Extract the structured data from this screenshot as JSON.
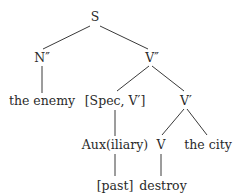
{
  "diagram": {
    "type": "syntax-tree",
    "nodes": [
      {
        "id": "S",
        "label": "S",
        "x": 95,
        "y": 17
      },
      {
        "id": "N2",
        "label": "N″",
        "x": 42,
        "y": 58
      },
      {
        "id": "V2",
        "label": "V″",
        "x": 152,
        "y": 58
      },
      {
        "id": "enemy",
        "label": "the enemy",
        "x": 42,
        "y": 101
      },
      {
        "id": "spec",
        "label": "[Spec, V′]",
        "x": 115,
        "y": 101
      },
      {
        "id": "V1",
        "label": "V′",
        "x": 186,
        "y": 101
      },
      {
        "id": "aux",
        "label": "Aux(iliary)",
        "x": 115,
        "y": 145
      },
      {
        "id": "V",
        "label": "V",
        "x": 161,
        "y": 145
      },
      {
        "id": "city",
        "label": "the city",
        "x": 208,
        "y": 145
      },
      {
        "id": "past",
        "label": "[past]",
        "x": 115,
        "y": 186
      },
      {
        "id": "destroy",
        "label": "destroy",
        "x": 163,
        "y": 186
      }
    ],
    "edges": [
      {
        "from": "S",
        "to": "N2",
        "x1": 90,
        "y1": 26,
        "x2": 43,
        "y2": 49
      },
      {
        "from": "S",
        "to": "V2",
        "x1": 100,
        "y1": 26,
        "x2": 148,
        "y2": 49
      },
      {
        "from": "N2",
        "to": "enemy",
        "x1": 42,
        "y1": 66,
        "x2": 42,
        "y2": 93
      },
      {
        "from": "V2",
        "to": "spec",
        "x1": 149,
        "y1": 66,
        "x2": 117,
        "y2": 91
      },
      {
        "from": "V2",
        "to": "V1",
        "x1": 152,
        "y1": 66,
        "x2": 184,
        "y2": 91
      },
      {
        "from": "spec",
        "to": "aux",
        "x1": 115,
        "y1": 110,
        "x2": 115,
        "y2": 136
      },
      {
        "from": "V1",
        "to": "V",
        "x1": 184,
        "y1": 109,
        "x2": 162,
        "y2": 135
      },
      {
        "from": "V1",
        "to": "city",
        "x1": 187,
        "y1": 109,
        "x2": 207,
        "y2": 135
      },
      {
        "from": "aux",
        "to": "past",
        "x1": 115,
        "y1": 154,
        "x2": 115,
        "y2": 176
      },
      {
        "from": "V",
        "to": "destroy",
        "x1": 161,
        "y1": 154,
        "x2": 161,
        "y2": 176
      }
    ],
    "colors": {
      "text": "#2a2a2a",
      "line": "#3a3a3a",
      "background": "#ffffff"
    }
  }
}
